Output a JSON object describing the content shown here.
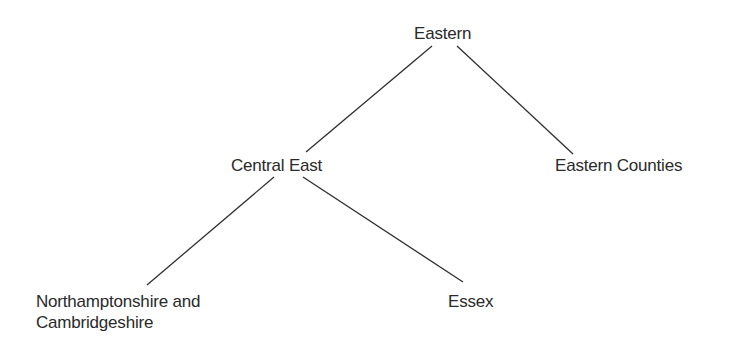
{
  "diagram": {
    "type": "tree",
    "nodes": {
      "root": {
        "label": "Eastern"
      },
      "central_east": {
        "label": "Central East"
      },
      "eastern_counties": {
        "label": "Eastern Counties"
      },
      "northants_cambs": {
        "line1": "Northamptonshire and",
        "line2": "Cambridgeshire"
      },
      "essex": {
        "label": "Essex"
      }
    },
    "edges": [
      {
        "from": "Eastern",
        "to": "Central East"
      },
      {
        "from": "Eastern",
        "to": "Eastern Counties"
      },
      {
        "from": "Central East",
        "to": "Northamptonshire and Cambridgeshire"
      },
      {
        "from": "Central East",
        "to": "Essex"
      }
    ],
    "line_color": "#2e2e2e",
    "text_color": "#2a2a2a"
  }
}
